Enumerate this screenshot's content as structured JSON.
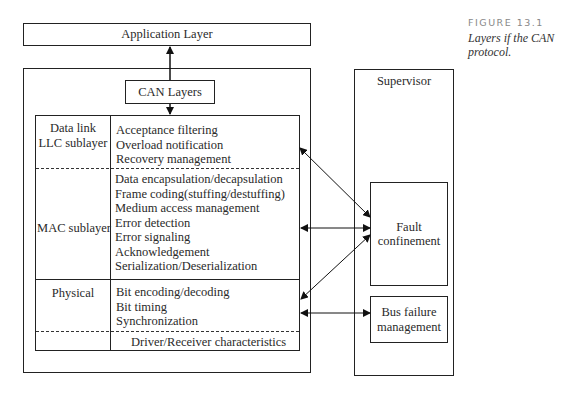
{
  "figure": {
    "label": "FIGURE 13.1",
    "caption_line1": "Layers if the CAN",
    "caption_line2": "protocol."
  },
  "application_layer": {
    "label": "Application Layer"
  },
  "can_layers": {
    "label": "CAN Layers",
    "rows": [
      {
        "label_line1": "Data link",
        "label_line2": "LLC sublayer",
        "items": [
          "Acceptance filtering",
          "Overload notification",
          "Recovery management"
        ]
      },
      {
        "label_line1": "MAC sublayer",
        "items": [
          "Data encapsulation/decapsulation",
          "Frame coding(stuffing/destuffing)",
          "Medium access management",
          "Error detection",
          "Error signaling",
          "Acknowledgement",
          "Serialization/Deserialization"
        ]
      },
      {
        "label_line1": "Physical",
        "items": [
          "Bit encoding/decoding",
          "Bit timing",
          "Synchronization"
        ]
      },
      {
        "items": [
          "Driver/Receiver characteristics"
        ]
      }
    ]
  },
  "supervisor": {
    "label": "Supervisor",
    "fault_confinement": {
      "line1": "Fault",
      "line2": "confinement"
    },
    "bus_failure": {
      "line1": "Bus failure",
      "line2": "management"
    }
  }
}
